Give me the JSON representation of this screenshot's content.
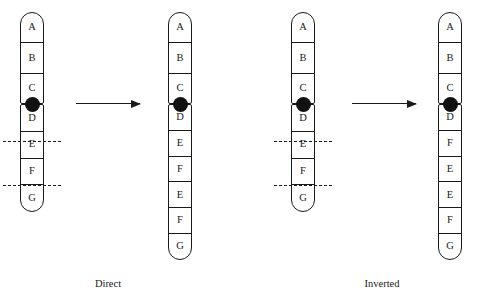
{
  "figure": {
    "type": "diagram",
    "background_color": "#ffffff",
    "line_color": "#1a1a1a",
    "centromere_color": "#111111"
  },
  "chromosomes": [
    {
      "id": "chrom-1",
      "role": "parent-left",
      "x": 20,
      "top_arm": {
        "y": 12,
        "height": 92,
        "bands": [
          "A",
          "B",
          "C"
        ]
      },
      "bottom_arm": {
        "y": 104,
        "height": 108,
        "bands": [
          "D",
          "E",
          "F",
          "G"
        ]
      },
      "centromere": {
        "cx": 32,
        "cy": 104,
        "r": 7.5
      },
      "breakpoints": [
        {
          "y": 141,
          "label": "upper-breakpoint"
        },
        {
          "y": 185,
          "label": "lower-breakpoint"
        }
      ]
    },
    {
      "id": "chrom-2",
      "role": "product-direct",
      "x": 168,
      "top_arm": {
        "y": 12,
        "height": 92,
        "bands": [
          "A",
          "B",
          "C"
        ]
      },
      "bottom_arm": {
        "y": 104,
        "height": 156,
        "bands": [
          "D",
          "E",
          "F",
          "E",
          "F",
          "G"
        ]
      },
      "centromere": {
        "cx": 180,
        "cy": 104,
        "r": 7.5
      },
      "breakpoints": []
    },
    {
      "id": "chrom-3",
      "role": "parent-right",
      "x": 291,
      "top_arm": {
        "y": 12,
        "height": 92,
        "bands": [
          "A",
          "B",
          "C"
        ]
      },
      "bottom_arm": {
        "y": 104,
        "height": 108,
        "bands": [
          "D",
          "E",
          "F",
          "G"
        ]
      },
      "centromere": {
        "cx": 303,
        "cy": 104,
        "r": 7.5
      },
      "breakpoints": [
        {
          "y": 141,
          "label": "upper-breakpoint"
        },
        {
          "y": 185,
          "label": "lower-breakpoint"
        }
      ]
    },
    {
      "id": "chrom-4",
      "role": "product-inverted",
      "x": 438,
      "top_arm": {
        "y": 12,
        "height": 92,
        "bands": [
          "A",
          "B",
          "C"
        ]
      },
      "bottom_arm": {
        "y": 104,
        "height": 156,
        "bands": [
          "D",
          "F",
          "E",
          "E",
          "F",
          "G"
        ]
      },
      "centromere": {
        "cx": 450,
        "cy": 104,
        "r": 7.5
      },
      "breakpoints": []
    }
  ],
  "arrows": [
    {
      "id": "arrow-direct",
      "x": 76,
      "y": 103,
      "length": 64
    },
    {
      "id": "arrow-inverted",
      "x": 352,
      "y": 103,
      "length": 64
    }
  ],
  "captions": {
    "direct": "Direct",
    "inverted": "Inverted"
  }
}
